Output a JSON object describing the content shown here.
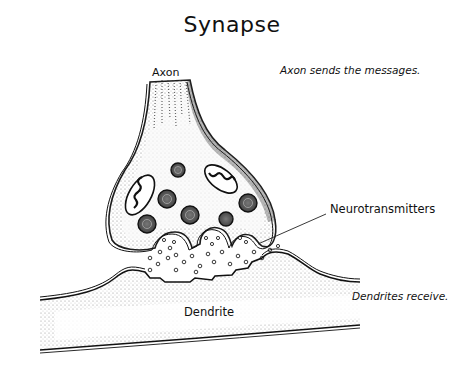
{
  "title": "Synapse",
  "labels": {
    "axon": "Axon",
    "axon_caption": "Axon sends the messages.",
    "neurotransmitters": "Neurotransmitters",
    "dendrite": "Dendrite",
    "dendrite_caption": "Dendrites receive."
  },
  "colors": {
    "background": "#ffffff",
    "ink": "#111111",
    "stipple": "#555555"
  }
}
